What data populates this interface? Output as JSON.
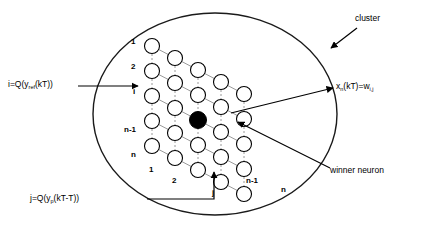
{
  "diagram": {
    "colors": {
      "stroke": "#000000",
      "grid_link": "#9a9a9a",
      "node_fill": "#ffffff",
      "winner_fill": "#000000",
      "background": "#ffffff"
    },
    "cluster_shape": {
      "type": "ellipse",
      "cx": 215,
      "cy": 114,
      "rx": 122,
      "ry": 101
    },
    "lattice": {
      "rows": 5,
      "cols": 5,
      "row_labels": [
        "1",
        "2",
        "i",
        "n-1",
        "n"
      ],
      "col_labels": [
        "1",
        "2",
        "j",
        "n-1",
        "n"
      ],
      "origin_x": 152,
      "origin_y": 46,
      "row_step_y": 25,
      "col_step_x": 23,
      "col_step_y": 12,
      "node_radius": 7.5,
      "winner_row_index": 2,
      "winner_col_index": 2
    },
    "annotations": {
      "input_i": {
        "text_plain": "i=Q(y_ref(kT))",
        "base": "i=Q(y",
        "sub": "ref",
        "tail": "(kT))",
        "x": 8,
        "y": 82
      },
      "input_j": {
        "text_plain": "j=Q(y_p(kT-T))",
        "base": "j=Q(y",
        "sub": "p",
        "tail": "(kT-T))",
        "x": 30,
        "y": 197
      },
      "output_x": {
        "text_plain": "x_n(kT)=w_i,j",
        "base": "x",
        "sub": "n",
        "mid": "(kT)=w",
        "sub2": "i,j",
        "x": 336,
        "y": 85
      },
      "cluster": {
        "text": "cluster",
        "x": 355,
        "y": 18
      },
      "winner": {
        "text": "winner neuron",
        "x": 330,
        "y": 169
      }
    }
  }
}
